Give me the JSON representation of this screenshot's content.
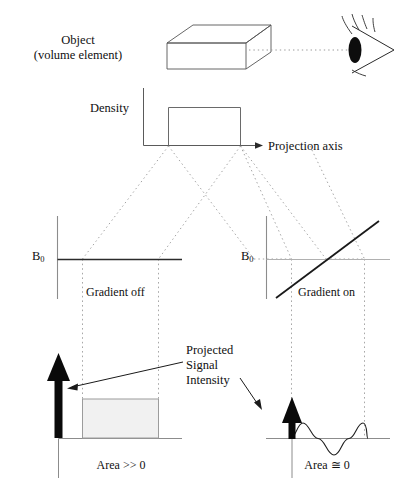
{
  "diagram": {
    "labels": {
      "object": "Object\n(volume element)",
      "density": "Density",
      "projection_axis": "Projection axis",
      "b0_left": "B",
      "b0_left_sub": "0",
      "b0_right": "B",
      "b0_right_sub": "0",
      "gradient_off": "Gradient off",
      "gradient_on": "Gradient on",
      "projected_signal": "Projected\nSignal\nIntensity",
      "area_left": "Area >> 0",
      "area_right": "Area ≅ 0"
    },
    "icons": {
      "eye": "eye-icon",
      "volume_box": "3d-box-icon",
      "up_arrow_large": "thick-up-arrow-icon",
      "up_arrow_small": "thick-up-arrow-small-icon",
      "axis_arrow": "right-arrow-icon"
    },
    "colors": {
      "stroke": "#1a1a1a",
      "line_gray": "#8c8c8c",
      "dotted": "#9a9a9a",
      "fill_light": "#f2f2f2",
      "background": "#ffffff"
    },
    "panels": [
      {
        "name": "gradient-off-panel",
        "field_label": "B0",
        "caption": "Gradient off",
        "field_type": "constant",
        "signal_shape": "rectangle",
        "area_label": "Area >> 0",
        "arrow_size": "large"
      },
      {
        "name": "gradient-on-panel",
        "field_label": "B0",
        "caption": "Gradient on",
        "field_type": "linear-ramp",
        "signal_shape": "sine-wave",
        "area_label": "Area ≅ 0",
        "arrow_size": "small"
      }
    ]
  }
}
